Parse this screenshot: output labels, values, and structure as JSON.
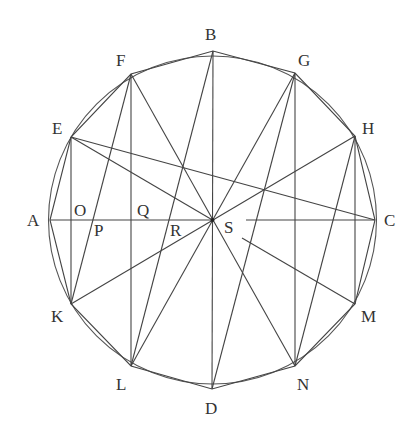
{
  "circle": {
    "cx": 212.5,
    "cy": 220,
    "r": 164
  },
  "points": {
    "A": [
      50,
      220
    ],
    "B": [
      213,
      51
    ],
    "C": [
      375,
      220
    ],
    "D": [
      212,
      389
    ],
    "E": [
      71,
      137
    ],
    "F": [
      131,
      74
    ],
    "G": [
      295,
      73
    ],
    "H": [
      355,
      136
    ],
    "K": [
      71,
      304
    ],
    "L": [
      131,
      366
    ],
    "M": [
      355,
      304
    ],
    "N": [
      295,
      366
    ],
    "S": [
      212.5,
      220
    ]
  },
  "labels": [
    {
      "text": "A",
      "x": 27,
      "y": 226
    },
    {
      "text": "B",
      "x": 205,
      "y": 40
    },
    {
      "text": "C",
      "x": 384,
      "y": 226
    },
    {
      "text": "D",
      "x": 205,
      "y": 414
    },
    {
      "text": "E",
      "x": 52,
      "y": 134
    },
    {
      "text": "F",
      "x": 116,
      "y": 66
    },
    {
      "text": "G",
      "x": 298,
      "y": 66
    },
    {
      "text": "H",
      "x": 362,
      "y": 134
    },
    {
      "text": "K",
      "x": 51,
      "y": 322
    },
    {
      "text": "L",
      "x": 116,
      "y": 390
    },
    {
      "text": "M",
      "x": 361,
      "y": 322
    },
    {
      "text": "N",
      "x": 297,
      "y": 390
    },
    {
      "text": "O",
      "x": 74,
      "y": 216
    },
    {
      "text": "P",
      "x": 94,
      "y": 236
    },
    {
      "text": "Q",
      "x": 137,
      "y": 216
    },
    {
      "text": "R",
      "x": 170,
      "y": 236
    },
    {
      "text": "S",
      "x": 224,
      "y": 233
    }
  ],
  "polygon": [
    "A",
    "E",
    "F",
    "B",
    "G",
    "H",
    "C",
    "M",
    "N",
    "D",
    "L",
    "K"
  ],
  "segments": [
    [
      "E",
      "K"
    ],
    [
      "F",
      "L"
    ],
    [
      "G",
      "N"
    ],
    [
      "H",
      "M"
    ],
    [
      "B",
      "D"
    ],
    [
      "A",
      "S"
    ],
    [
      "E",
      "C"
    ],
    [
      "E",
      "S"
    ],
    [
      "F",
      "K"
    ],
    [
      "F",
      "N"
    ],
    [
      "G",
      "L"
    ],
    [
      "G",
      "D"
    ],
    [
      "H",
      "K"
    ],
    [
      "H",
      "N"
    ],
    [
      "B",
      "L"
    ]
  ],
  "partial_segments": [
    {
      "name": "s-to-c",
      "from": [
        246,
        220
      ],
      "to": [
        375,
        220
      ]
    },
    {
      "name": "s-to-m",
      "from": [
        242,
        238
      ],
      "to": [
        355,
        304
      ]
    }
  ]
}
